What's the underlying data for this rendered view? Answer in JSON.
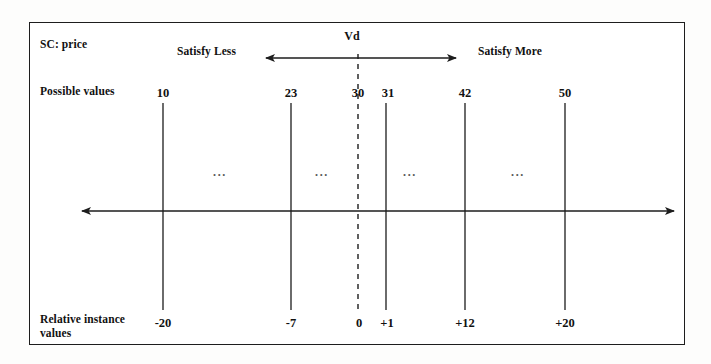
{
  "diagram": {
    "title_label": "SC: price",
    "row_labels": {
      "possible_values": "Possible values",
      "relative_instance_values_line1": "Relative instance",
      "relative_instance_values_line2": "values"
    },
    "direction_labels": {
      "left": "Satisfy Less",
      "right": "Satisfy More"
    },
    "reference_marker": {
      "name": "Vd",
      "possible_value": "30",
      "relative_value": "0"
    },
    "ellipsis": "...",
    "ellipsis_positions_x": [
      220,
      322,
      410,
      518
    ],
    "axis": {
      "left_arrow": true,
      "right_arrow": true,
      "y": 211
    },
    "ticks": [
      {
        "x": 163,
        "possible_value": "10",
        "relative_value": "-20",
        "dashed": false
      },
      {
        "x": 291,
        "possible_value": "23",
        "relative_value": "-7",
        "dashed": false
      },
      {
        "x": 358,
        "possible_value": "30",
        "relative_value": "0",
        "dashed": true
      },
      {
        "x": 386,
        "possible_value": "31",
        "relative_value": "+1",
        "dashed": false
      },
      {
        "x": 465,
        "possible_value": "42",
        "relative_value": "+12",
        "dashed": false
      },
      {
        "x": 565,
        "possible_value": "50",
        "relative_value": "+20",
        "dashed": false
      }
    ],
    "colors": {
      "ink": "#1d1d1d",
      "paper": "#ffffff",
      "page": "#fdfdfc",
      "faint": "#555555"
    }
  }
}
